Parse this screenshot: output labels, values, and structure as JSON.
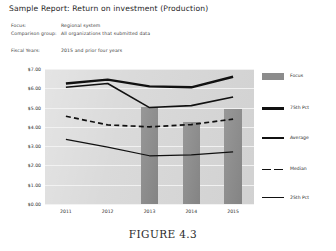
{
  "report": {
    "title": "Sample Report: Return on investment (Production)",
    "meta": [
      {
        "label": "Focus:",
        "value": "Regional system"
      },
      {
        "label": "Comparison group:",
        "value": "All organizations that submitted data"
      }
    ],
    "fiscal": {
      "label": "Fiscal Years:",
      "value": "2015 and prior four years"
    }
  },
  "caption": "FIGURE 4.3",
  "legend": {
    "items": [
      {
        "label": "Focus",
        "style": "bar",
        "color": "#8c8c8c"
      },
      {
        "label": "75th Pct",
        "style": "thick",
        "color": "#111111"
      },
      {
        "label": "Average",
        "style": "medium",
        "color": "#111111"
      },
      {
        "label": "Median",
        "style": "dashed",
        "color": "#111111"
      },
      {
        "label": "25th Pct",
        "style": "thin",
        "color": "#111111"
      }
    ]
  },
  "chart_data": {
    "type": "line",
    "title": "",
    "xlabel": "",
    "ylabel": "",
    "grid": true,
    "legend_position": "right",
    "categories": [
      "2011",
      "2012",
      "2013",
      "2014",
      "2015"
    ],
    "ytick_labels": [
      "$7.00",
      "$6.00",
      "$5.00",
      "$4.00",
      "$3.00",
      "$2.00",
      "$1.00",
      "$0.00"
    ],
    "ytick_values": [
      7,
      6,
      5,
      4,
      3,
      2,
      1,
      0
    ],
    "ylim": [
      0,
      7
    ],
    "series": [
      {
        "name": "Focus",
        "type": "bar",
        "values": [
          null,
          null,
          5.05,
          4.25,
          4.95
        ]
      },
      {
        "name": "75th Pct",
        "type": "line",
        "values": [
          6.25,
          6.45,
          6.1,
          6.05,
          6.6
        ]
      },
      {
        "name": "Average",
        "type": "line",
        "values": [
          6.05,
          6.25,
          5.0,
          5.1,
          5.55
        ]
      },
      {
        "name": "Median",
        "type": "dashed",
        "values": [
          4.55,
          4.1,
          4.0,
          4.12,
          4.4
        ]
      },
      {
        "name": "25th Pct",
        "type": "line",
        "values": [
          3.35,
          2.95,
          2.5,
          2.55,
          2.7
        ]
      }
    ]
  }
}
